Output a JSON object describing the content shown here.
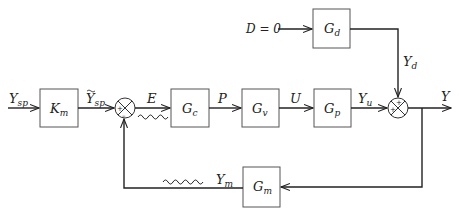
{
  "diagram": {
    "type": "feedback-control-block-diagram",
    "blocks": {
      "Km": {
        "main": "K",
        "sub": "m"
      },
      "Gc": {
        "main": "G",
        "sub": "c"
      },
      "Gv": {
        "main": "G",
        "sub": "v"
      },
      "Gp": {
        "main": "G",
        "sub": "p"
      },
      "Gd": {
        "main": "G",
        "sub": "d"
      },
      "Gm": {
        "main": "G",
        "sub": "m"
      }
    },
    "signals": {
      "Ysp": {
        "main": "Y",
        "sub": "sp"
      },
      "Ysp_tilde": {
        "main": "Y",
        "sub": "sp"
      },
      "E": {
        "main": "E"
      },
      "P": {
        "main": "P"
      },
      "U": {
        "main": "U"
      },
      "Yu": {
        "main": "Y",
        "sub": "u"
      },
      "Yd": {
        "main": "Y",
        "sub": "d"
      },
      "Y": {
        "main": "Y"
      },
      "Ym": {
        "main": "Y",
        "sub": "m"
      },
      "D": {
        "text": "D = 0"
      }
    },
    "junctions": {
      "sum1": {
        "signs": [
          "+",
          "–"
        ]
      },
      "sum2": {
        "signs": [
          "+",
          "+"
        ]
      }
    },
    "colors": {
      "line": "#222222",
      "box_border": "#555555"
    }
  }
}
